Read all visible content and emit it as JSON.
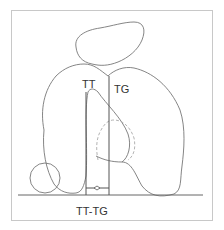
{
  "diagram": {
    "labels": {
      "tt": "TT",
      "tg": "TG",
      "measure": "TT-TG"
    },
    "colors": {
      "outline": "#777777",
      "line": "#555555",
      "dashed": "#aaaaaa",
      "frame": "#c8c8c8"
    }
  }
}
